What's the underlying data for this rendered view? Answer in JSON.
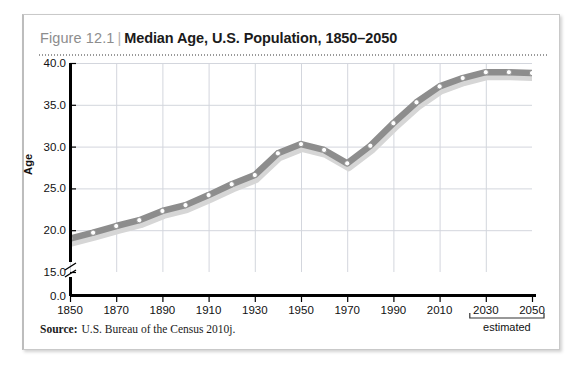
{
  "figure": {
    "number": "Figure 12.1",
    "separator": "|",
    "title": "Median Age, U.S. Population, 1850–2050",
    "source_word": "Source:",
    "source_text": "U.S. Bureau of the Census 2010j."
  },
  "chart_data": {
    "type": "line",
    "title": "Median Age, U.S. Population, 1850–2050",
    "xlabel": "",
    "ylabel": "Age",
    "grid": true,
    "legend": false,
    "axis_break": true,
    "xlim": [
      1850,
      2050
    ],
    "ylim": [
      15.0,
      40.0
    ],
    "ytick_labels": [
      "40.0",
      "35.0",
      "30.0",
      "25.0",
      "20.0",
      "15.0",
      "0.0"
    ],
    "yticks": [
      40.0,
      35.0,
      30.0,
      25.0,
      20.0,
      15.0,
      0.0
    ],
    "xtick_labels": [
      "1850",
      "1870",
      "1890",
      "1910",
      "1930",
      "1950",
      "1970",
      "1990",
      "2010",
      "2030",
      "2050"
    ],
    "xticks": [
      1850,
      1870,
      1890,
      1910,
      1930,
      1950,
      1970,
      1990,
      2010,
      2030,
      2050
    ],
    "annotation": "estimated",
    "annotation_range": [
      2030,
      2050
    ],
    "x": [
      1850,
      1860,
      1870,
      1880,
      1890,
      1900,
      1910,
      1920,
      1930,
      1940,
      1950,
      1960,
      1970,
      1980,
      1990,
      2000,
      2010,
      2020,
      2030,
      2040,
      2050
    ],
    "values": [
      19.0,
      19.7,
      20.5,
      21.2,
      22.3,
      23.0,
      24.2,
      25.5,
      26.6,
      29.2,
      30.3,
      29.6,
      28.0,
      30.1,
      32.8,
      35.3,
      37.2,
      38.2,
      38.9,
      38.9,
      38.8
    ],
    "series": [
      {
        "name": "Median age",
        "values": [
          19.0,
          19.7,
          20.5,
          21.2,
          22.3,
          23.0,
          24.2,
          25.5,
          26.6,
          29.2,
          30.3,
          29.6,
          28.0,
          30.1,
          32.8,
          35.3,
          37.2,
          38.2,
          38.9,
          38.9,
          38.8
        ]
      }
    ]
  },
  "colors": {
    "line": "#8d8d8d",
    "line_shadow": "#d6d6d6",
    "marker_fill": "#ffffff",
    "marker_stroke": "#8d8d8d",
    "grid": "#d3d6dd",
    "axis": "#000000",
    "figure_number": "#8d8d8d",
    "title": "#1b1b1b"
  }
}
